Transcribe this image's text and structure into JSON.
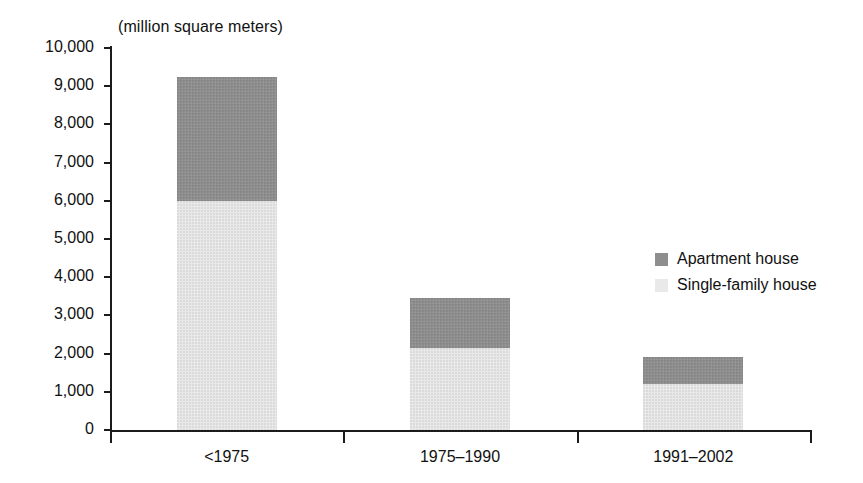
{
  "chart_data": {
    "type": "bar",
    "subtype": "stacked-vertical",
    "title": "(million square meters)",
    "xlabel": "",
    "ylabel": "",
    "unit": "million square meters",
    "categories": [
      "<1975",
      "1975–1990",
      "1991–2002"
    ],
    "series": [
      {
        "name": "Single-family house",
        "color": "#e9e9e9",
        "values": [
          6000,
          2150,
          1200
        ]
      },
      {
        "name": "Apartment house",
        "color": "#8e8e8e",
        "values": [
          3250,
          1300,
          700
        ]
      }
    ],
    "totals": [
      9250,
      3450,
      1900
    ],
    "ylim": [
      0,
      10000
    ],
    "ytick_step": 1000,
    "ytick_labels": [
      "0",
      "1,000",
      "2,000",
      "3,000",
      "4,000",
      "5,000",
      "6,000",
      "7,000",
      "8,000",
      "9,000",
      "10,000"
    ],
    "ytick_values": [
      0,
      1000,
      2000,
      3000,
      4000,
      5000,
      6000,
      7000,
      8000,
      9000,
      10000
    ],
    "grid": false,
    "legend_position": "right-middle",
    "legend_order": [
      "Apartment house",
      "Single-family house"
    ]
  },
  "legend": {
    "items": [
      {
        "label": "Apartment house",
        "color": "#8e8e8e"
      },
      {
        "label": "Single-family house",
        "color": "#e9e9e9"
      }
    ]
  },
  "colors": {
    "axis": "#1b1b1b",
    "text": "#111111",
    "background": "#ffffff",
    "apartment": "#8e8e8e",
    "single_family": "#e9e9e9"
  }
}
